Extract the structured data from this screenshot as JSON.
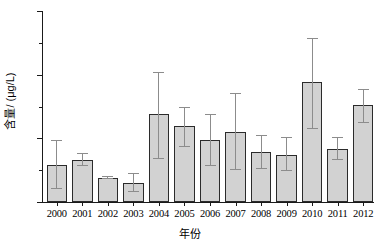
{
  "chart_data": {
    "type": "bar",
    "title": "",
    "subtitle": "",
    "xlabel": "年份",
    "ylabel": "含量/ (μg/L)",
    "categories": [
      "2000",
      "2001",
      "2002",
      "2003",
      "2004",
      "2005",
      "2006",
      "2007",
      "2008",
      "2009",
      "2010",
      "2011",
      "2012"
    ],
    "values": [
      0.29,
      0.33,
      0.19,
      0.15,
      0.69,
      0.6,
      0.49,
      0.55,
      0.39,
      0.37,
      0.94,
      0.42,
      0.76
    ],
    "error_low": [
      0.1,
      0.28,
      0.18,
      0.08,
      0.34,
      0.43,
      0.28,
      0.25,
      0.26,
      0.24,
      0.57,
      0.33,
      0.62
    ],
    "error_high": [
      0.48,
      0.38,
      0.2,
      0.22,
      1.01,
      0.74,
      0.68,
      0.85,
      0.52,
      0.5,
      1.28,
      0.5,
      0.88
    ],
    "ylim": [
      0.0,
      1.5
    ],
    "ytick_labels": [
      "0.0",
      "0.5",
      "1.0",
      "1.5"
    ],
    "ytick_values": [
      0.0,
      0.5,
      1.0,
      1.5
    ],
    "ytick_minor_values": [
      0.25,
      0.75,
      1.25
    ],
    "grid": false,
    "legend": false,
    "legend_position": "none",
    "bar_color": "#d2d2d2",
    "bar_edge_color": "#2b2b2b",
    "error_bar_color": "#8c8c8c",
    "axis_color": "#1a1a1a",
    "background_color": "#ffffff"
  }
}
